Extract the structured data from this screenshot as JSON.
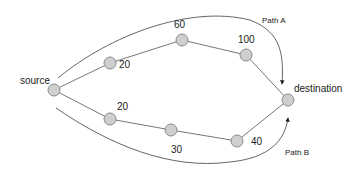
{
  "diagram": {
    "nodes": {
      "source": {
        "label": "source"
      },
      "destination": {
        "label": "destination"
      },
      "top1": {
        "label": "20"
      },
      "top2": {
        "label": "60"
      },
      "top3": {
        "label": "100"
      },
      "bot1": {
        "label": "20"
      },
      "bot2": {
        "label": "30"
      },
      "bot3": {
        "label": "40"
      }
    },
    "paths": {
      "a": {
        "label": "Path A"
      },
      "b": {
        "label": "Path B"
      }
    },
    "colors": {
      "node_fill": "#cfcfcf",
      "node_stroke": "#8a8a8a",
      "edge": "#777777"
    }
  }
}
